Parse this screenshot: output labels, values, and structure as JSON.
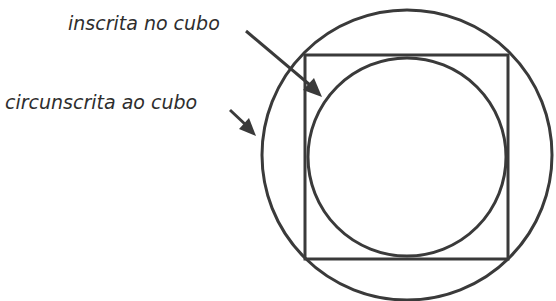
{
  "diagram": {
    "labels": {
      "inscribed": "inscrita no cubo",
      "circumscribed": "circunscrita ao cubo"
    },
    "geometry": {
      "outer_circle": {
        "cx": 407,
        "cy": 155,
        "r": 145
      },
      "square": {
        "x": 305,
        "y": 55,
        "width": 203,
        "height": 204
      },
      "inner_circle": {
        "cx": 407,
        "cy": 157,
        "r": 99
      }
    },
    "colors": {
      "stroke": "#3a3a3a",
      "text": "#2e2e2e",
      "background": "#ffffff"
    }
  }
}
